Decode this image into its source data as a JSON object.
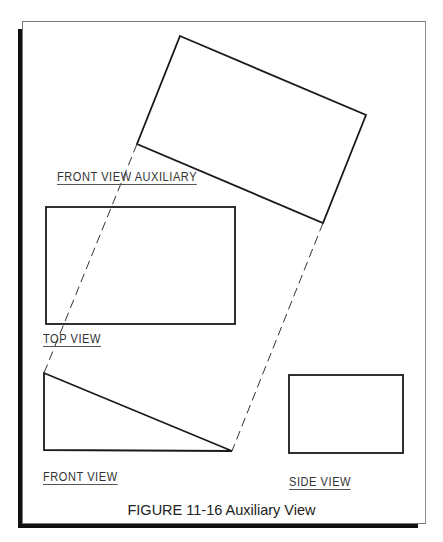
{
  "figure": {
    "caption": "FIGURE 11-16  Auxiliary View",
    "colors": {
      "line": "#1a1a1a",
      "dash": "#333333",
      "frame": "#7a7a7a",
      "shadow": "#111111",
      "text": "#333333"
    }
  },
  "labels": {
    "front_view_auxiliary": "FRONT VIEW AUXILIARY",
    "top_view": "TOP VIEW",
    "front_view": "FRONT VIEW",
    "side_view": "SIDE VIEW"
  },
  "shapes": {
    "auxiliary_view_rect": {
      "points": [
        [
          180,
          36
        ],
        [
          366,
          115
        ],
        [
          323,
          223
        ],
        [
          137,
          144
        ]
      ]
    },
    "top_view_rect": {
      "x": 46,
      "y": 207,
      "width": 189,
      "height": 117
    },
    "front_view_triangle": {
      "points": [
        [
          44,
          373
        ],
        [
          44,
          450
        ],
        [
          232,
          451
        ]
      ]
    },
    "side_view_rect": {
      "x": 289,
      "y": 375,
      "width": 114,
      "height": 78
    },
    "projection_lines": [
      {
        "from": [
          137,
          144
        ],
        "to": [
          44,
          373
        ]
      },
      {
        "from": [
          323,
          223
        ],
        "to": [
          232,
          451
        ]
      }
    ]
  }
}
